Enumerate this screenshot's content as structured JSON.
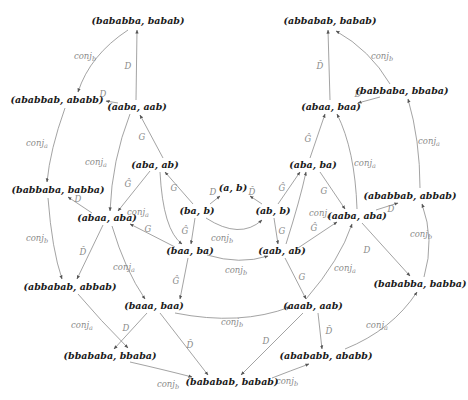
{
  "diagram": {
    "type": "directed-graph",
    "colors": {
      "node_text": "#1a1a1a",
      "edge": "#8c8c8c",
      "edge_label": "#8a8a8a",
      "background": "#ffffff"
    },
    "nodes": [
      {
        "id": "n0",
        "label": "(bababba, babab)",
        "x": 138,
        "y": 21
      },
      {
        "id": "n1",
        "label": "(abbabab, babab)",
        "x": 330,
        "y": 21
      },
      {
        "id": "n2",
        "label": "(ababbab, ababb)",
        "x": 57,
        "y": 100
      },
      {
        "id": "n3",
        "label": "(aaba, aab)",
        "x": 137,
        "y": 107
      },
      {
        "id": "n4",
        "label": "(babbaba, bbaba)",
        "x": 402,
        "y": 91
      },
      {
        "id": "n5",
        "label": "(abaa, baa)",
        "x": 331,
        "y": 107
      },
      {
        "id": "n6",
        "label": "(aba, ab)",
        "x": 155,
        "y": 165
      },
      {
        "id": "n7",
        "label": "(aba, ba)",
        "x": 313,
        "y": 165
      },
      {
        "id": "n8",
        "label": "(a, b)",
        "x": 233,
        "y": 188
      },
      {
        "id": "n9",
        "label": "(babbaba, babba)",
        "x": 58,
        "y": 190
      },
      {
        "id": "n10",
        "label": "(abaa, aba)",
        "x": 107,
        "y": 218
      },
      {
        "id": "n11",
        "label": "(ba, b)",
        "x": 197,
        "y": 211
      },
      {
        "id": "n12",
        "label": "(ab, b)",
        "x": 273,
        "y": 211
      },
      {
        "id": "n13",
        "label": "(aaba, aba)",
        "x": 357,
        "y": 216
      },
      {
        "id": "n14",
        "label": "(ababbab, abbab)",
        "x": 410,
        "y": 196
      },
      {
        "id": "n15",
        "label": "(baa, ba)",
        "x": 190,
        "y": 251
      },
      {
        "id": "n16",
        "label": "(aab, ab)",
        "x": 282,
        "y": 251
      },
      {
        "id": "n17",
        "label": "(abbabab, abbab)",
        "x": 70,
        "y": 287
      },
      {
        "id": "n18",
        "label": "(baaa, baa)",
        "x": 154,
        "y": 306
      },
      {
        "id": "n19",
        "label": "(aaab, aab)",
        "x": 313,
        "y": 306
      },
      {
        "id": "n20",
        "label": "(bababba, babba)",
        "x": 420,
        "y": 284
      },
      {
        "id": "n21",
        "label": "(bbababa, bbaba)",
        "x": 110,
        "y": 356
      },
      {
        "id": "n22",
        "label": "(abababb, ababb)",
        "x": 326,
        "y": 356
      },
      {
        "id": "n23",
        "label": "(bababab, babab)",
        "x": 232,
        "y": 382
      }
    ],
    "edges": [
      {
        "from": "n0",
        "to": "n2",
        "label": "conj_b",
        "d": "M128,30 Q90,55 78,92",
        "lx": 85,
        "ly": 56
      },
      {
        "from": "n3",
        "to": "n0",
        "label": "D",
        "d": "M136,100 L137,30",
        "lx": 128,
        "ly": 66
      },
      {
        "from": "n3",
        "to": "n2",
        "label": "D",
        "d": "M118,103 L106,101",
        "lx": 103,
        "ly": 94
      },
      {
        "from": "n2",
        "to": "n9",
        "label": "conj_a",
        "d": "M65,108 Q50,150 47,182",
        "lx": 37,
        "ly": 143
      },
      {
        "from": "n3",
        "to": "n10",
        "label": "conj_a",
        "d": "M130,114 Q112,160 110,211",
        "lx": 96,
        "ly": 162
      },
      {
        "from": "n6",
        "to": "n3",
        "label": "G",
        "d": "M163,158 L140,115",
        "lx": 142,
        "ly": 137
      },
      {
        "from": "n6",
        "to": "n10",
        "label": "Ĝ",
        "d": "M150,171 L118,211",
        "lx": 128,
        "ly": 184
      },
      {
        "from": "n6",
        "to": "n15",
        "label": "conj_a",
        "d": "M160,172 Q163,230 182,244",
        "lx": 138,
        "ly": 212
      },
      {
        "from": "n11",
        "to": "n6",
        "label": "G",
        "d": "M193,204 L165,172",
        "lx": 174,
        "ly": 188
      },
      {
        "from": "n11",
        "to": "n8",
        "label": "D",
        "d": "M210,204 L220,196",
        "lx": 213,
        "ly": 192
      },
      {
        "from": "n12",
        "to": "n8",
        "label": "D̂",
        "d": "M262,204 L250,196",
        "lx": 252,
        "ly": 192
      },
      {
        "from": "n11",
        "to": "n12",
        "label": "conj_b",
        "d": "M206,218 Q240,240 262,220",
        "lx": 222,
        "ly": 238
      },
      {
        "from": "n11",
        "to": "n15",
        "label": "Ĝ",
        "d": "M195,218 L191,244",
        "lx": 185,
        "ly": 231
      },
      {
        "from": "n15",
        "to": "n10",
        "label": "G",
        "d": "M175,247 L130,224",
        "lx": 148,
        "ly": 229
      },
      {
        "from": "n10",
        "to": "n9",
        "label": "D",
        "d": "M92,213 L68,197",
        "lx": 78,
        "ly": 199
      },
      {
        "from": "n9",
        "to": "n17",
        "label": "conj_b",
        "d": "M48,198 Q52,250 62,279",
        "lx": 37,
        "ly": 238
      },
      {
        "from": "n10",
        "to": "n17",
        "label": "D̂",
        "d": "M103,225 L77,279",
        "lx": 83,
        "ly": 252
      },
      {
        "from": "n10",
        "to": "n18",
        "label": "conj_a",
        "d": "M112,226 Q125,270 145,299",
        "lx": 124,
        "ly": 267
      },
      {
        "from": "n15",
        "to": "n16",
        "label": "conj_b",
        "d": "M207,255 Q240,265 268,256",
        "lx": 236,
        "ly": 270
      },
      {
        "from": "n15",
        "to": "n18",
        "label": "Ĝ",
        "d": "M188,258 L180,299",
        "lx": 176,
        "ly": 281
      },
      {
        "from": "n12",
        "to": "n7",
        "label": "Ĝ",
        "d": "M278,204 L300,172",
        "lx": 282,
        "ly": 188
      },
      {
        "from": "n12",
        "to": "n16",
        "label": "G",
        "d": "M274,218 L278,244",
        "lx": 282,
        "ly": 231
      },
      {
        "from": "n16",
        "to": "n7",
        "label": "conj_a",
        "d": "M286,244 Q300,200 306,172",
        "lx": 320,
        "ly": 213
      },
      {
        "from": "n7",
        "to": "n5",
        "label": "Ĝ",
        "d": "M310,158 L325,114",
        "lx": 308,
        "ly": 139
      },
      {
        "from": "n7",
        "to": "n13",
        "label": "G",
        "d": "M320,172 L345,209",
        "lx": 324,
        "ly": 191
      },
      {
        "from": "n16",
        "to": "n13",
        "label": "Ĝ",
        "d": "M298,248 L337,222",
        "lx": 314,
        "ly": 228
      },
      {
        "from": "n13",
        "to": "n5",
        "label": "conj_a",
        "d": "M357,209 Q355,150 337,114",
        "lx": 365,
        "ly": 163
      },
      {
        "from": "n5",
        "to": "n1",
        "label": "D̂",
        "d": "M330,100 L328,30",
        "lx": 320,
        "ly": 66
      },
      {
        "from": "n4",
        "to": "n5",
        "label": "D",
        "d": "M380,97 L358,103",
        "lx": 358,
        "ly": 94
      },
      {
        "from": "n4",
        "to": "n1",
        "label": "conj_b",
        "d": "M390,84 Q370,50 336,31",
        "lx": 382,
        "ly": 56
      },
      {
        "from": "n14",
        "to": "n4",
        "label": "conj_a",
        "d": "M420,188 Q420,140 408,99",
        "lx": 429,
        "ly": 141
      },
      {
        "from": "n13",
        "to": "n14",
        "label": "D",
        "d": "M376,210 L398,203",
        "lx": 391,
        "ly": 209
      },
      {
        "from": "n13",
        "to": "n20",
        "label": "D",
        "d": "M362,223 L410,276",
        "lx": 367,
        "ly": 250
      },
      {
        "from": "n20",
        "to": "n14",
        "label": "conj_b",
        "d": "M424,277 Q435,240 422,204",
        "lx": 421,
        "ly": 234
      },
      {
        "from": "n19",
        "to": "n13",
        "label": "conj_a",
        "d": "M306,299 Q340,260 352,224",
        "lx": 345,
        "ly": 268
      },
      {
        "from": "n16",
        "to": "n19",
        "label": "G",
        "d": "M285,258 L306,299",
        "lx": 302,
        "ly": 277
      },
      {
        "from": "n18",
        "to": "n19",
        "label": "conj_b",
        "d": "M175,313 Q240,326 290,307",
        "lx": 232,
        "ly": 322
      },
      {
        "from": "n18",
        "to": "n21",
        "label": "D",
        "d": "M147,313 L114,349",
        "lx": 126,
        "ly": 328
      },
      {
        "from": "n18",
        "to": "n23",
        "label": "D̂",
        "d": "M160,313 L208,375",
        "lx": 190,
        "ly": 345
      },
      {
        "from": "n17",
        "to": "n21",
        "label": "conj_a",
        "d": "M78,294 Q100,320 128,348",
        "lx": 82,
        "ly": 325
      },
      {
        "from": "n21",
        "to": "n23",
        "label": "conj_b",
        "d": "M130,362 Q165,370 192,377",
        "lx": 168,
        "ly": 384
      },
      {
        "from": "n19",
        "to": "n23",
        "label": "D",
        "d": "M303,313 L241,375",
        "lx": 266,
        "ly": 341
      },
      {
        "from": "n19",
        "to": "n22",
        "label": "D̂",
        "d": "M318,313 L322,349",
        "lx": 329,
        "ly": 331
      },
      {
        "from": "n23",
        "to": "n22",
        "label": "conj_b",
        "d": "M272,378 Q290,371 309,364",
        "lx": 287,
        "ly": 381
      },
      {
        "from": "n22",
        "to": "n20",
        "label": "conj_a",
        "d": "M345,349 Q392,330 417,292",
        "lx": 377,
        "ly": 325
      }
    ]
  }
}
